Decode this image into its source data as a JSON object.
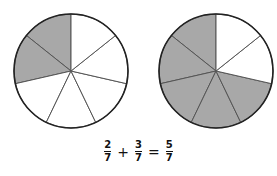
{
  "diagram": {
    "colors": {
      "shaded": "#a8a8a8",
      "unshaded": "#ffffff",
      "stroke": "#222222",
      "divider": "#555555"
    },
    "pies": [
      {
        "name": "pie-two-sevenths",
        "cx": 71,
        "cy": 71,
        "r": 57,
        "slices": 7,
        "shaded": 2
      },
      {
        "name": "pie-five-sevenths",
        "cx": 216,
        "cy": 71,
        "r": 57,
        "slices": 7,
        "shaded": 5
      }
    ]
  },
  "equation": {
    "term1": {
      "numerator": "2",
      "denominator": "7"
    },
    "plus": "+",
    "term2": {
      "numerator": "3",
      "denominator": "7"
    },
    "equals": "=",
    "result": {
      "numerator": "5",
      "denominator": "7"
    }
  }
}
